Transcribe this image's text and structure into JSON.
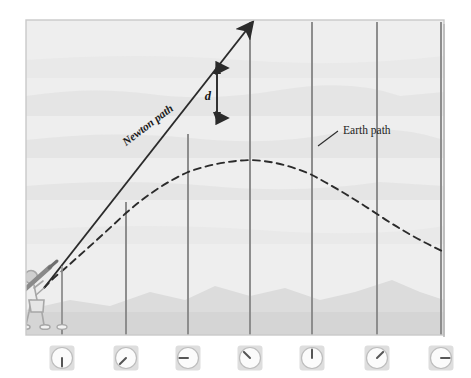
{
  "figure": {
    "panel": {
      "x": 26,
      "y": 20,
      "width": 418,
      "height": 315,
      "sky_color": "#eeeeee",
      "border_color": "#cfcfcf",
      "ground_color": "#d9d9d9",
      "haze_color": "#e4e4e4"
    }
  },
  "labels": {
    "newton_path": "Newton path",
    "earth_path": "Earth path",
    "distance": "d"
  },
  "colors": {
    "line": "#2b2b2b",
    "gridline": "#8d8d8d",
    "figure_stroke": "#a7a7a7",
    "clock_face": "#fbfbfb",
    "clock_box": "#dedede",
    "clock_hand": "#555555"
  },
  "chart_data": {
    "type": "line",
    "xlabel": "",
    "ylabel": "",
    "xlim": [
      26,
      444
    ],
    "ylim": [
      335,
      20
    ],
    "grid": true,
    "legend": "inline-annotations",
    "annotations": [
      {
        "text": "Newton path",
        "x": 150,
        "y": 120,
        "rotation": -37
      },
      {
        "text": "Earth path",
        "x": 355,
        "y": 130,
        "rotation": 0
      },
      {
        "text": "d",
        "x": 212,
        "y": 96,
        "rotation": 0
      }
    ],
    "series": [
      {
        "name": "Newton path",
        "style": "solid",
        "arrow_end": true,
        "points": [
          [
            44,
            288
          ],
          [
            62,
            268
          ],
          [
            126,
            200
          ],
          [
            188,
            134
          ],
          [
            255,
            20
          ]
        ]
      },
      {
        "name": "Earth path",
        "style": "dashed",
        "arrow_end": false,
        "points": [
          [
            44,
            288
          ],
          [
            62,
            271
          ],
          [
            95,
            240
          ],
          [
            126,
            213
          ],
          [
            157,
            190
          ],
          [
            188,
            174
          ],
          [
            219,
            164
          ],
          [
            250,
            160
          ],
          [
            281,
            163
          ],
          [
            312,
            174
          ],
          [
            343,
            192
          ],
          [
            377,
            215
          ],
          [
            410,
            236
          ],
          [
            442,
            251
          ]
        ]
      }
    ],
    "gridlines_x": [
      62,
      126,
      188,
      250,
      312,
      377,
      441
    ],
    "distance_marker": {
      "label": "d",
      "x": 217,
      "y_top": 68,
      "y_bottom": 118
    }
  },
  "clocks": [
    {
      "id": "clock-1",
      "x": 62,
      "hand_angle_deg": 180,
      "reading": "6 o'clock"
    },
    {
      "id": "clock-2",
      "x": 126,
      "hand_angle_deg": 225,
      "reading": "7:30"
    },
    {
      "id": "clock-3",
      "x": 188,
      "hand_angle_deg": 270,
      "reading": "9 o'clock"
    },
    {
      "id": "clock-4",
      "x": 250,
      "hand_angle_deg": 315,
      "reading": "10:30"
    },
    {
      "id": "clock-5",
      "x": 312,
      "hand_angle_deg": 0,
      "reading": "12 o'clock"
    },
    {
      "id": "clock-6",
      "x": 377,
      "hand_angle_deg": 45,
      "reading": "1:30"
    },
    {
      "id": "clock-7",
      "x": 441,
      "hand_angle_deg": 90,
      "reading": "3 o'clock"
    }
  ],
  "observer": {
    "name": "stick-figure-observer",
    "description": "stick figure holding launcher aimed up-right"
  }
}
